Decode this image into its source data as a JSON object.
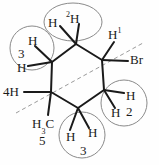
{
  "diagram": {
    "type": "chemical-structure",
    "colors": {
      "bond": "#1a1a1a",
      "circle": "#8a8a8a",
      "dashed": "#9a9a9a",
      "text": "#1a1a1a",
      "background": "#fefefe"
    },
    "labels": {
      "h_top_left": "H",
      "h_top_deuterium_sup": "2",
      "h_top_deuterium": "H",
      "h_left_upper": "H",
      "h_left_number": "3",
      "h_left_lower": "H",
      "h_right_top_sup": "1",
      "h_right_top": "H",
      "bromine": "Br",
      "h_right_upper": "H",
      "h_right_lower": "H",
      "h_right_number": "2",
      "h_far_left": "4H",
      "methyl_h": "H",
      "methyl_sub": "3",
      "methyl_c": "C",
      "methyl_number": "5",
      "h_bottom_left": "H",
      "h_bottom_right": "H",
      "h_bottom_number": "3"
    }
  }
}
